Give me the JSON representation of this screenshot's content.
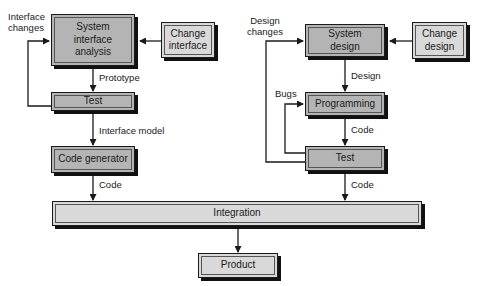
{
  "diagram": {
    "type": "flowchart",
    "left_flow": {
      "boxes": {
        "system_interface_analysis": "System\ninterface\nanalysis",
        "change_interface": "Change\ninterface",
        "test": "Test",
        "code_generator": "Code generator"
      },
      "edge_labels": {
        "interface_changes": "Interface\nchanges",
        "prototype": "Prototype",
        "interface_model": "Interface model",
        "code": "Code"
      }
    },
    "right_flow": {
      "boxes": {
        "system_design": "System\ndesign",
        "change_design": "Change\ndesign",
        "programming": "Programming",
        "test": "Test"
      },
      "edge_labels": {
        "design_changes": "Design\nchanges",
        "design": "Design",
        "bugs": "Bugs",
        "code_1": "Code",
        "code_2": "Code"
      }
    },
    "shared": {
      "integration": "Integration",
      "product": "Product"
    },
    "colors": {
      "dark_box": "#b4b4b4",
      "light_box": "#d9d9d9",
      "line": "#1a1a1a",
      "shadow": "#111111"
    }
  }
}
